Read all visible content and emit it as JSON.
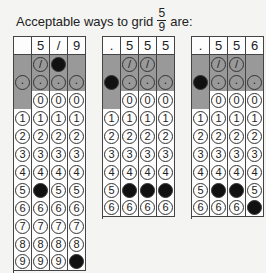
{
  "title": {
    "prefix": "Acceptable ways to grid",
    "fraction_numerator": "5",
    "fraction_denominator": "9",
    "suffix": "are:"
  },
  "grid_rows": {
    "slash_symbol": "/",
    "decimal_symbol": ".",
    "digits": [
      "0",
      "1",
      "2",
      "3",
      "4",
      "5",
      "6",
      "7",
      "8",
      "9"
    ]
  },
  "grids": [
    {
      "id": "grid-fraction",
      "left": 13,
      "rows_visible": 10,
      "header": [
        "",
        "5",
        "/",
        "9"
      ],
      "filled": {
        "col0": null,
        "col1": "5",
        "col2": "/",
        "col3": "9"
      }
    },
    {
      "id": "grid-decimal-555",
      "left": 102,
      "rows_visible": 7,
      "header": [
        ".",
        "5",
        "5",
        "5"
      ],
      "filled": {
        "col0": ".",
        "col1": "5",
        "col2": "5",
        "col3": "5"
      }
    },
    {
      "id": "grid-decimal-556",
      "left": 191,
      "rows_visible": 7,
      "header": [
        ".",
        "5",
        "5",
        "6"
      ],
      "filled": {
        "col0": ".",
        "col1": "5",
        "col2": "5",
        "col3": "6"
      }
    }
  ],
  "colors": {
    "band_gray": "#999999",
    "fill": "#111111",
    "background": "#f4f4f2"
  }
}
